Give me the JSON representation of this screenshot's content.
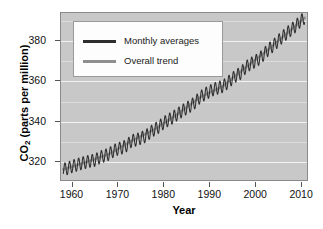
{
  "chart_data": {
    "type": "line",
    "title": "",
    "xlabel": "Year",
    "ylabel": "CO2 (parts per million)",
    "ylabel_prefix": "CO",
    "ylabel_sub": "2",
    "ylabel_suffix": " (parts per million)",
    "xlim": [
      1957.5,
      2011.5
    ],
    "ylim": [
      310,
      394
    ],
    "xticks": [
      1960,
      1970,
      1980,
      1990,
      2000,
      2010
    ],
    "xtick_labels": [
      "1960",
      "1970",
      "1980",
      "1990",
      "2000",
      "2010"
    ],
    "yticks": [
      320,
      340,
      360,
      380
    ],
    "ytick_labels": [
      "320",
      "340",
      "360",
      "380"
    ],
    "grid": "horizontal-white-on-gray",
    "gridlines_major": [
      320,
      340,
      360,
      380
    ],
    "gridlines_minor": [
      330,
      350,
      370,
      390
    ],
    "legend_position": "top-left-inside",
    "panel_color": "#c8c8c8",
    "gridline_color": "#f2f2f2",
    "series": [
      {
        "name": "Monthly averages",
        "color": "#2e2e2e",
        "style": "sawtooth-seasonal",
        "seasonal_amplitude_ppm": 3.2,
        "x": [
          1958,
          1959,
          1960,
          1961,
          1962,
          1963,
          1964,
          1965,
          1966,
          1967,
          1968,
          1969,
          1970,
          1971,
          1972,
          1973,
          1974,
          1975,
          1976,
          1977,
          1978,
          1979,
          1980,
          1981,
          1982,
          1983,
          1984,
          1985,
          1986,
          1987,
          1988,
          1989,
          1990,
          1991,
          1992,
          1993,
          1994,
          1995,
          1996,
          1997,
          1998,
          1999,
          2000,
          2001,
          2002,
          2003,
          2004,
          2005,
          2006,
          2007,
          2008,
          2009,
          2010,
          2011
        ],
        "values": [
          315.3,
          315.9,
          316.9,
          317.6,
          318.4,
          319.0,
          319.6,
          320.0,
          321.4,
          322.2,
          323.0,
          324.6,
          325.7,
          326.3,
          327.5,
          329.7,
          330.2,
          331.1,
          332.0,
          333.8,
          335.4,
          336.8,
          338.7,
          340.1,
          341.4,
          343.0,
          344.6,
          346.0,
          347.4,
          349.2,
          351.6,
          353.1,
          354.4,
          355.6,
          356.4,
          357.1,
          358.8,
          360.8,
          362.6,
          363.8,
          366.6,
          368.3,
          369.5,
          371.0,
          373.1,
          375.6,
          377.4,
          379.6,
          381.8,
          383.7,
          385.6,
          387.4,
          389.8,
          391.6
        ]
      },
      {
        "name": "Overall trend",
        "color": "#8f8f8f",
        "style": "smooth",
        "x": [
          1958,
          1963,
          1968,
          1973,
          1978,
          1983,
          1988,
          1993,
          1998,
          2003,
          2008,
          2011
        ],
        "values": [
          315.3,
          319.0,
          323.0,
          329.7,
          335.4,
          343.0,
          351.6,
          357.1,
          366.6,
          375.6,
          385.6,
          391.6
        ]
      }
    ]
  },
  "legend": {
    "items": [
      {
        "label": "Monthly averages",
        "swatch": "monthly"
      },
      {
        "label": "Overall trend",
        "swatch": "trend"
      }
    ]
  }
}
